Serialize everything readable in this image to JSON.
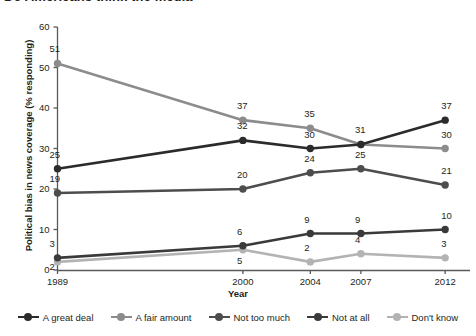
{
  "chart_data": {
    "type": "line",
    "title": "Do Americans think the media",
    "title_visible_fragment": "Do Americans think the media",
    "xlabel": "Year",
    "ylabel": "Political bias in news coverage (% responding)",
    "x": [
      "1989",
      "2000",
      "2004",
      "2007",
      "2012"
    ],
    "x_positions": [
      0,
      11,
      15,
      18,
      23
    ],
    "xlim": [
      0,
      24
    ],
    "ylim": [
      0,
      60
    ],
    "yticks": [
      0,
      10,
      20,
      30,
      40,
      50,
      60
    ],
    "grid": false,
    "legend_position": "bottom",
    "series": [
      {
        "name": "A great deal",
        "color": "#2b2b2b",
        "values": [
          25,
          32,
          30,
          31,
          37
        ]
      },
      {
        "name": "A fair amount",
        "color": "#8c8c8c",
        "values": [
          51,
          37,
          35,
          31,
          30
        ]
      },
      {
        "name": "Not too much",
        "color": "#4d4d4d",
        "values": [
          19,
          20,
          24,
          25,
          21
        ]
      },
      {
        "name": "Not at all",
        "color": "#3a3a3a",
        "values": [
          3,
          6,
          9,
          9,
          10
        ]
      },
      {
        "name": "Don't know",
        "color": "#b3b3b3",
        "values": [
          2,
          5,
          2,
          4,
          3
        ]
      }
    ]
  },
  "axis": {
    "y_tick_labels": [
      "0",
      "10",
      "20",
      "30",
      "40",
      "50",
      "60"
    ],
    "x_tick_labels": [
      "1989",
      "2000",
      "2004",
      "2007",
      "2012"
    ]
  },
  "legend": {
    "items": [
      {
        "label": "A great deal",
        "color": "#2b2b2b"
      },
      {
        "label": "A fair amount",
        "color": "#8c8c8c"
      },
      {
        "label": "Not too much",
        "color": "#4d4d4d"
      },
      {
        "label": "Not at all",
        "color": "#3a3a3a"
      },
      {
        "label": "Don't know",
        "color": "#b3b3b3"
      }
    ]
  }
}
